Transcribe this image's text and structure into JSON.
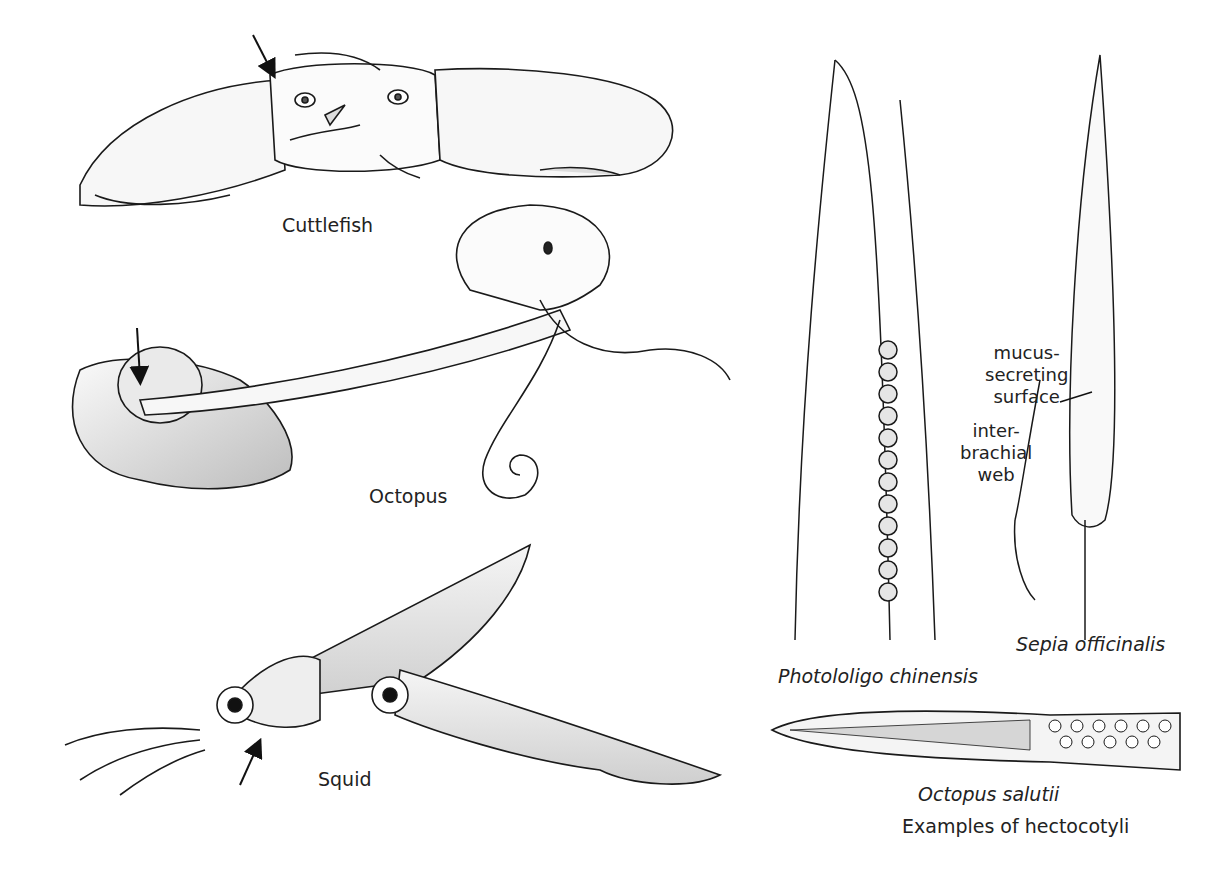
{
  "figure": {
    "panels": [
      {
        "id": "cuttlefish",
        "label": "Cuttlefish"
      },
      {
        "id": "octopus",
        "label": "Octopus"
      },
      {
        "id": "squid",
        "label": "Squid"
      }
    ],
    "hectocotyli": {
      "caption": "Examples of hectocotyli",
      "species": [
        {
          "id": "photololigo",
          "label": "Photololigo chinensis"
        },
        {
          "id": "sepia",
          "label": "Sepia officinalis"
        },
        {
          "id": "octopus-salutii",
          "label": "Octopus salutii"
        }
      ],
      "annotations": [
        {
          "id": "mucus",
          "label": "mucus-\nsecreting\nsurface"
        },
        {
          "id": "web",
          "label": "inter-\nbrachial\nweb"
        }
      ]
    },
    "colors": {
      "line": "#1a1a1a",
      "fill_light": "#f2f2f2",
      "fill_mid": "#d0d0d0",
      "fill_dark": "#a8a8a8"
    }
  }
}
